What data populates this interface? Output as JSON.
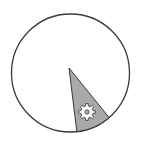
{
  "chart_data": {
    "type": "pie",
    "title": "",
    "slices": [
      {
        "label": "gear-slice",
        "value": 9,
        "color": "#a9a9a9",
        "icon": "gear-icon",
        "start_deg": 51,
        "end_deg": 83
      },
      {
        "label": "remainder",
        "value": 91,
        "color": "#ffffff"
      }
    ],
    "center": [
      70,
      70
    ],
    "radius": 59,
    "outline_color": "#3a3a3a",
    "legend": []
  },
  "colors": {
    "background": "#ffffff",
    "outline": "#3a3a3a",
    "slice_fill": "#a9a9a9",
    "gear_fill": "#ffffff",
    "gear_stroke": "#444444"
  }
}
